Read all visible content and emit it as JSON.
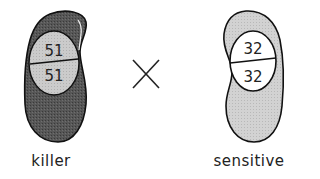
{
  "diagram": {
    "type": "genetic cross",
    "operator": "×",
    "cells": [
      {
        "label": "killer",
        "cell_fill": "#575757",
        "nucleus_fill": "#c9c9c9",
        "nucleus_top": "51",
        "nucleus_bottom": "51"
      },
      {
        "label": "sensitive",
        "cell_fill": "#cfcfcf",
        "nucleus_fill": "#ffffff",
        "nucleus_top": "32",
        "nucleus_bottom": "32"
      }
    ]
  }
}
